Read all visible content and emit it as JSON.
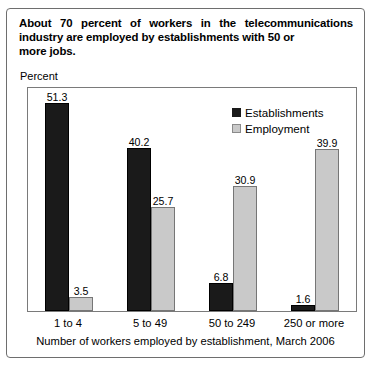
{
  "figure": {
    "title_line1": "About 70 percent of workers in the telecommunications",
    "title_line2": "industry are employed by establishments with 50 or",
    "title_line3": "more jobs.",
    "percent_label": "Percent"
  },
  "chart_data": {
    "type": "bar",
    "title": "About 70 percent of workers in the telecommunications industry are employed by establishments with 50 or more jobs.",
    "xlabel": "Number of workers employed by establishment, March 2006",
    "ylabel": "Percent",
    "ylim": [
      0,
      55
    ],
    "grid": false,
    "legend_position": "top-right",
    "categories": [
      "1 to 4",
      "5 to 49",
      "50 to 249",
      "250 or more"
    ],
    "series": [
      {
        "name": "Establishments",
        "color": "#1a1a1a",
        "values": [
          51.3,
          40.2,
          6.8,
          1.6
        ]
      },
      {
        "name": "Employment",
        "color": "#c9c9c9",
        "values": [
          3.5,
          25.7,
          30.9,
          39.9
        ]
      }
    ]
  }
}
